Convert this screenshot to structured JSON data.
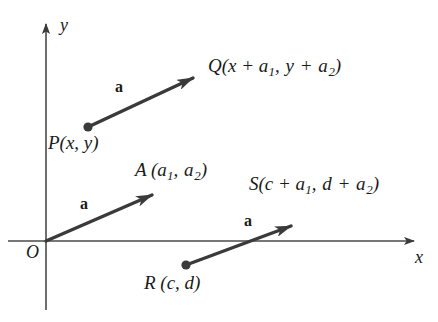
{
  "figure": {
    "background_color": "#ffffff",
    "stroke_color": "#333333",
    "axis_color": "#4a4a4a"
  },
  "axes": {
    "x_label": "x",
    "y_label": "y",
    "origin_label": "O",
    "x_axis": {
      "y": 241,
      "x_start": 8,
      "x_end": 420
    },
    "y_axis": {
      "x": 46,
      "y_start": 18,
      "y_end": 310
    }
  },
  "vectors": [
    {
      "name": "vector-pq",
      "label": "a",
      "from": {
        "x": 88,
        "y": 127
      },
      "to": {
        "x": 203,
        "y": 74
      },
      "tail_dot": true,
      "label_pos": {
        "x": 115,
        "y": 79
      }
    },
    {
      "name": "vector-oa",
      "label": "a",
      "from": {
        "x": 46,
        "y": 241
      },
      "to": {
        "x": 162,
        "y": 191
      },
      "tail_dot": false,
      "label_pos": {
        "x": 80,
        "y": 196
      }
    },
    {
      "name": "vector-rs",
      "label": "a",
      "from": {
        "x": 186,
        "y": 265
      },
      "to": {
        "x": 302,
        "y": 221
      },
      "tail_dot": true,
      "label_pos": {
        "x": 244,
        "y": 213
      }
    }
  ],
  "points": [
    {
      "name": "point-q-label",
      "text_parts": [
        "Q(x + a",
        "1",
        ", y + a",
        "2",
        ")"
      ],
      "pos": {
        "x": 208,
        "y": 56
      }
    },
    {
      "name": "point-p-label",
      "text_parts": [
        "P(x, y)"
      ],
      "pos": {
        "x": 48,
        "y": 133
      }
    },
    {
      "name": "point-a-label",
      "text_parts": [
        "A (a",
        "1",
        ", a",
        "2",
        ")"
      ],
      "pos": {
        "x": 135,
        "y": 160
      }
    },
    {
      "name": "point-s-label",
      "text_parts": [
        "S(c + a",
        "1",
        ", d + a",
        "2",
        ")"
      ],
      "pos": {
        "x": 249,
        "y": 174
      }
    },
    {
      "name": "point-r-label",
      "text_parts": [
        "R (c, d)"
      ],
      "pos": {
        "x": 144,
        "y": 273
      }
    }
  ],
  "labels": {
    "q": {
      "main1": "Q(x + a",
      "sub1": "1",
      "main2": ", y + a",
      "sub2": "2",
      "main3": ")"
    },
    "p": {
      "text": "P(x, y)"
    },
    "a_point": {
      "main1": "A (a",
      "sub1": "1",
      "main2": ", a",
      "sub2": "2",
      "main3": ")"
    },
    "s": {
      "main1": "S(c + a",
      "sub1": "1",
      "main2": ", d + a",
      "sub2": "2",
      "main3": ")"
    },
    "r": {
      "text": "R (c, d)"
    },
    "vec_a_1": "a",
    "vec_a_2": "a",
    "vec_a_3": "a",
    "x_axis": "x",
    "y_axis": "y",
    "origin": "O"
  }
}
